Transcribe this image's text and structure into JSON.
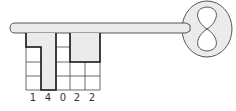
{
  "diagram": {
    "colors": {
      "fill": "#ebebeb",
      "stroke": "#555555",
      "grid_line": "#444444",
      "bold_line": "#222222",
      "text": "#333333"
    },
    "grid": {
      "columns": 5,
      "rows": 4,
      "column_heights": [
        3,
        4,
        0,
        2,
        2
      ]
    },
    "labels": [
      "1",
      "4",
      "0",
      "2",
      "2"
    ]
  }
}
